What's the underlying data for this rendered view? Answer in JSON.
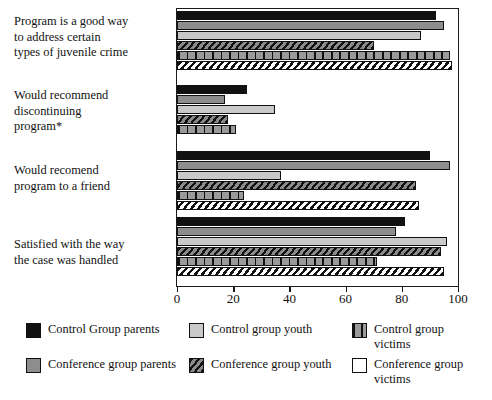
{
  "chart_data": {
    "type": "bar",
    "orientation": "horizontal",
    "title": "",
    "subtitle": "",
    "xlabel": "",
    "ylabel": "",
    "xlim": [
      0,
      100
    ],
    "xticks": [
      0,
      20,
      40,
      60,
      80,
      100
    ],
    "xtick_labels": [
      "0",
      "20",
      "40",
      "60",
      "80",
      "100"
    ],
    "grid": false,
    "legend_position": "bottom",
    "footnote": "",
    "categories": [
      "Program is a good way to address certain types of juvenile crime",
      "Would recommend discontinuing program*",
      "Would recomend program to a friend",
      "Satisfied with the way the case was handled"
    ],
    "category_lines": [
      [
        "Program is a good way",
        "to address certain",
        "types of juvenile crime"
      ],
      [
        "Would recommend",
        "discontinuing",
        "program*"
      ],
      [
        "Would recomend",
        "program to a friend"
      ],
      [
        "Satisfied with the way",
        "the case was handled"
      ]
    ],
    "series": [
      {
        "name": "Control Group parents",
        "pattern": "solid-black",
        "color": "#111111",
        "values": [
          92,
          25,
          90,
          81
        ]
      },
      {
        "name": "Conference group parents",
        "pattern": "solid-midgray",
        "color": "#8d8d8d",
        "values": [
          95,
          17,
          97,
          78
        ]
      },
      {
        "name": "Control group youth",
        "pattern": "solid-lightgray",
        "color": "#c9c9c9",
        "values": [
          87,
          35,
          37,
          96
        ]
      },
      {
        "name": "Conference group youth",
        "pattern": "diagonal-hatch",
        "color": "#8a8a8a",
        "values": [
          70,
          18,
          85,
          94
        ]
      },
      {
        "name": "Control group victims",
        "pattern": "vertical-stripe",
        "color": "#9a9a9a",
        "values": [
          97,
          21,
          24,
          71
        ]
      },
      {
        "name": "Conference group victims",
        "pattern": "white-diagonal",
        "color": "#ffffff",
        "values": [
          98,
          0,
          86,
          95
        ]
      }
    ]
  },
  "legend": {
    "items": [
      {
        "label": "Control Group parents",
        "swatch": "legend-swatch-control-group-parents"
      },
      {
        "label": "Control group youth",
        "swatch": "legend-swatch-control-group-youth"
      },
      {
        "label": "Control group victims",
        "swatch": "legend-swatch-control-group-victims"
      },
      {
        "label": "Conference group parents",
        "swatch": "legend-swatch-conference-group-parents"
      },
      {
        "label": "Conference group youth",
        "swatch": "legend-swatch-conference-group-youth"
      },
      {
        "label": "Conference group victims",
        "swatch": "legend-swatch-conference-group-victims"
      }
    ],
    "wrapped_labels": [
      [
        "Control Group parents"
      ],
      [
        "Control group youth"
      ],
      [
        "Control group",
        "victims"
      ],
      [
        "Conference group",
        "parents"
      ],
      [
        "Conference group",
        "youth"
      ],
      [
        "Conference group",
        "victims"
      ]
    ]
  }
}
